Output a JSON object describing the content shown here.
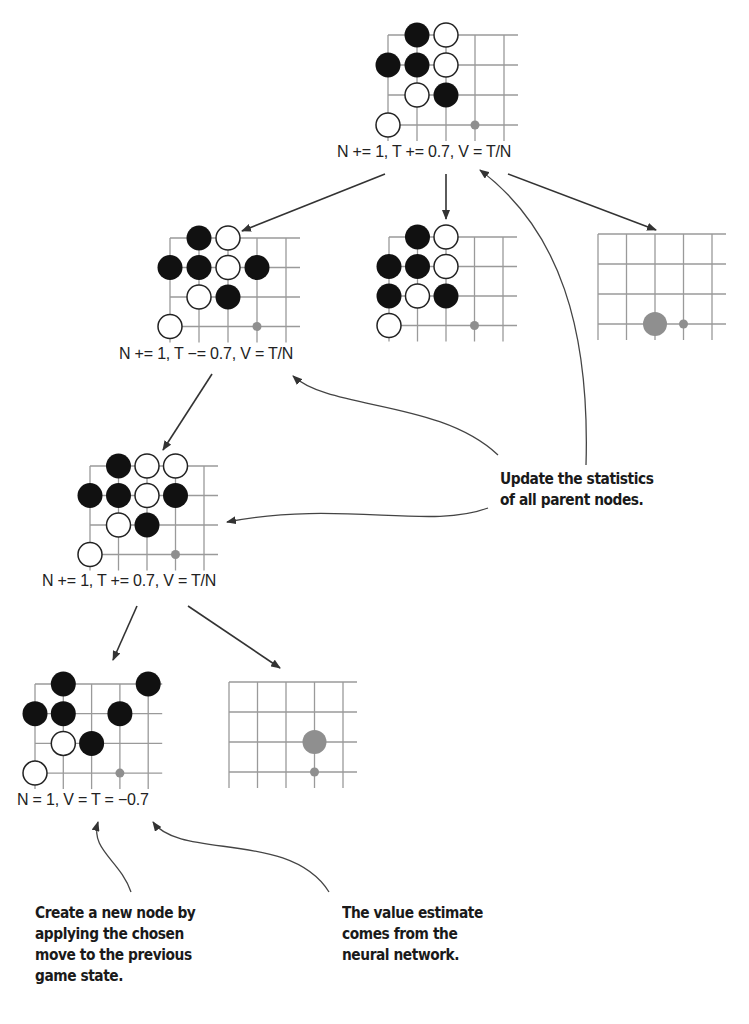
{
  "diagram": {
    "colors": {
      "grid": "#9a9a9a",
      "black_stone": "#111111",
      "white_stone": "#ffffff",
      "stone_outline": "#222222",
      "candidate_move": "#8f8f8f",
      "arrow": "#333333",
      "text": "#222222"
    },
    "nodes": [
      {
        "id": "root",
        "label": "N += 1, T += 0.7, V = T/N",
        "board": {
          "origin": [
            388,
            35
          ],
          "step": [
            29,
            30
          ]
        },
        "stones": [
          {
            "c": "B",
            "x": 1,
            "y": 0
          },
          {
            "c": "W",
            "x": 2,
            "y": 0
          },
          {
            "c": "B",
            "x": 0,
            "y": 1
          },
          {
            "c": "B",
            "x": 1,
            "y": 1
          },
          {
            "c": "W",
            "x": 2,
            "y": 1
          },
          {
            "c": "W",
            "x": 1,
            "y": 2
          },
          {
            "c": "B",
            "x": 2,
            "y": 2
          },
          {
            "c": "W",
            "x": 0,
            "y": 3
          },
          {
            "c": "dot",
            "x": 3,
            "y": 3
          }
        ]
      },
      {
        "id": "child-left",
        "label": "N += 1, T −= 0.7, V = T/N",
        "board": {
          "origin": [
            170,
            238
          ],
          "step": [
            29,
            29.5
          ]
        },
        "stones": [
          {
            "c": "B",
            "x": 1,
            "y": 0
          },
          {
            "c": "W",
            "x": 2,
            "y": 0
          },
          {
            "c": "B",
            "x": 0,
            "y": 1
          },
          {
            "c": "B",
            "x": 1,
            "y": 1
          },
          {
            "c": "W",
            "x": 2,
            "y": 1
          },
          {
            "c": "B",
            "x": 3,
            "y": 1
          },
          {
            "c": "W",
            "x": 1,
            "y": 2
          },
          {
            "c": "B",
            "x": 2,
            "y": 2
          },
          {
            "c": "W",
            "x": 0,
            "y": 3
          },
          {
            "c": "dot",
            "x": 3,
            "y": 3
          }
        ]
      },
      {
        "id": "child-middle",
        "label": "",
        "board": {
          "origin": [
            389,
            237
          ],
          "step": [
            28.5,
            29.5
          ]
        },
        "stones": [
          {
            "c": "B",
            "x": 1,
            "y": 0
          },
          {
            "c": "W",
            "x": 2,
            "y": 0
          },
          {
            "c": "B",
            "x": 0,
            "y": 1
          },
          {
            "c": "B",
            "x": 1,
            "y": 1
          },
          {
            "c": "W",
            "x": 2,
            "y": 1
          },
          {
            "c": "B",
            "x": 0,
            "y": 2
          },
          {
            "c": "W",
            "x": 1,
            "y": 2
          },
          {
            "c": "B",
            "x": 2,
            "y": 2
          },
          {
            "c": "W",
            "x": 0,
            "y": 3
          },
          {
            "c": "dot",
            "x": 3,
            "y": 3
          }
        ]
      },
      {
        "id": "child-right",
        "label": "",
        "board": {
          "origin": [
            598,
            234
          ],
          "step": [
            28.5,
            30
          ]
        },
        "stones": [
          {
            "c": "G",
            "x": 2,
            "y": 3
          },
          {
            "c": "dot",
            "x": 3,
            "y": 3
          }
        ]
      },
      {
        "id": "grandchild",
        "label": "N += 1, T += 0.7, V = T/N",
        "board": {
          "origin": [
            90,
            466
          ],
          "step": [
            28.5,
            29.5
          ]
        },
        "stones": [
          {
            "c": "B",
            "x": 1,
            "y": 0
          },
          {
            "c": "W",
            "x": 2,
            "y": 0
          },
          {
            "c": "W",
            "x": 3,
            "y": 0
          },
          {
            "c": "B",
            "x": 0,
            "y": 1
          },
          {
            "c": "B",
            "x": 1,
            "y": 1
          },
          {
            "c": "W",
            "x": 2,
            "y": 1
          },
          {
            "c": "B",
            "x": 3,
            "y": 1
          },
          {
            "c": "W",
            "x": 1,
            "y": 2
          },
          {
            "c": "B",
            "x": 2,
            "y": 2
          },
          {
            "c": "W",
            "x": 0,
            "y": 3
          },
          {
            "c": "dot",
            "x": 3,
            "y": 3
          }
        ]
      },
      {
        "id": "new-leaf",
        "label": "N = 1, V = T = −0.7",
        "board": {
          "origin": [
            35,
            684
          ],
          "step": [
            28.3,
            29.7
          ]
        },
        "stones": [
          {
            "c": "B",
            "x": 1,
            "y": 0
          },
          {
            "c": "B",
            "x": 4,
            "y": 0
          },
          {
            "c": "B",
            "x": 0,
            "y": 1
          },
          {
            "c": "B",
            "x": 1,
            "y": 1
          },
          {
            "c": "B",
            "x": 3,
            "y": 1
          },
          {
            "c": "W",
            "x": 1,
            "y": 2
          },
          {
            "c": "B",
            "x": 2,
            "y": 2
          },
          {
            "c": "W",
            "x": 0,
            "y": 3
          },
          {
            "c": "dot",
            "x": 3,
            "y": 3
          }
        ]
      },
      {
        "id": "leaf-sibling",
        "label": "",
        "board": {
          "origin": [
            229,
            682
          ],
          "step": [
            28.5,
            30
          ]
        },
        "stones": [
          {
            "c": "G",
            "x": 3,
            "y": 2
          },
          {
            "c": "dot",
            "x": 3,
            "y": 3
          }
        ]
      }
    ],
    "callouts": {
      "update_parents": "Update the statistics\nof all parent nodes.",
      "create_node": "Create a new node by\napplying the chosen\nmove to the previous\ngame state.",
      "value_estimate": "The value estimate\ncomes from the\nneural network."
    },
    "labels": {
      "root": "N += 1, T += 0.7, V = T/N",
      "child_left": "N += 1, T −= 0.7, V = T/N",
      "grandchild": "N += 1, T += 0.7, V = T/N",
      "new_leaf": "N = 1, V = T = −0.7"
    }
  }
}
